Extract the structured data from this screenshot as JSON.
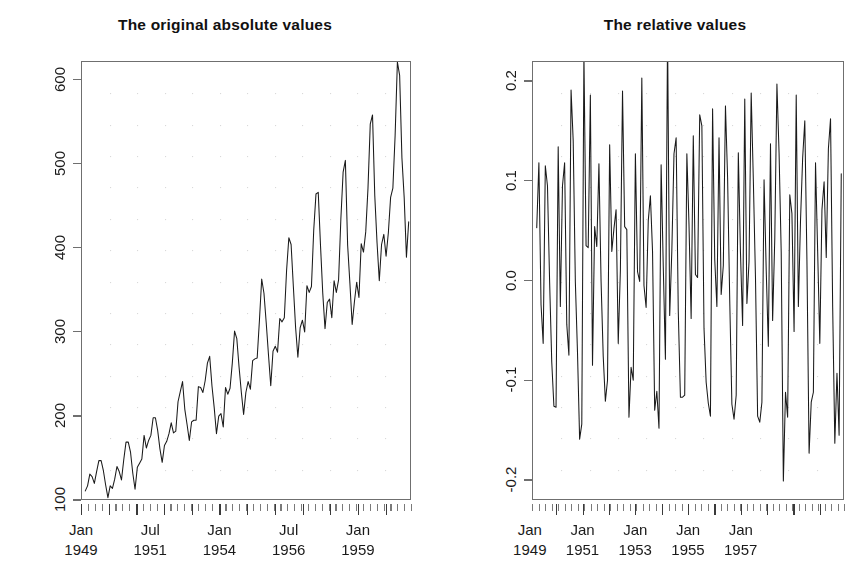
{
  "figure": {
    "width": 794,
    "height": 585,
    "background": "#ffffff",
    "axis_color": "#6f6f6f",
    "line_color": "#1a1a1a",
    "grid_color": "#d9d9d9",
    "panels": 2
  },
  "left_panel": {
    "title": "The original absolute values",
    "y_ticks": [
      "100",
      "200",
      "300",
      "400",
      "500",
      "600"
    ],
    "x_ticks": [
      {
        "month": "Jan",
        "year": "1949"
      },
      {
        "month": "Jul",
        "year": "1951"
      },
      {
        "month": "Jan",
        "year": "1954"
      },
      {
        "month": "Jul",
        "year": "1956"
      },
      {
        "month": "Jan",
        "year": "1959"
      }
    ]
  },
  "right_panel": {
    "title": "The relative values",
    "y_ticks": [
      "-0.2",
      "-0.1",
      "0.0",
      "0.1",
      "0.2"
    ],
    "x_ticks": [
      {
        "month": "Jan",
        "year": "1949"
      },
      {
        "month": "Jan",
        "year": "1951"
      },
      {
        "month": "Jan",
        "year": "1953"
      },
      {
        "month": "Jan",
        "year": "1955"
      },
      {
        "month": "Jan",
        "year": "1957"
      }
    ],
    "clipped_right_edge": true
  },
  "chart_data": [
    {
      "type": "line",
      "id": "absolute",
      "title": "The original absolute values",
      "xlabel": "",
      "ylabel": "",
      "grid": true,
      "legend": "none",
      "xlim": [
        1949.0,
        1960.917
      ],
      "ylim": [
        100,
        622
      ],
      "ytick_values": [
        100,
        200,
        300,
        400,
        500,
        600
      ],
      "xtick_values": [
        1949.0,
        1951.5,
        1954.0,
        1956.5,
        1959.0
      ],
      "xtick_labels": [
        "Jan 1949",
        "Jul 1951",
        "Jan 1954",
        "Jul 1956",
        "Jan 1959"
      ],
      "x_start": 1949.0,
      "x_step": 0.0833333,
      "values": [
        112,
        118,
        132,
        129,
        121,
        135,
        148,
        148,
        136,
        119,
        104,
        118,
        115,
        126,
        141,
        135,
        125,
        149,
        170,
        170,
        158,
        133,
        114,
        140,
        145,
        150,
        178,
        163,
        172,
        178,
        199,
        199,
        184,
        162,
        146,
        166,
        171,
        180,
        193,
        181,
        183,
        218,
        230,
        242,
        209,
        191,
        172,
        194,
        196,
        196,
        236,
        235,
        229,
        243,
        264,
        272,
        237,
        211,
        180,
        201,
        204,
        188,
        235,
        227,
        234,
        264,
        302,
        293,
        259,
        229,
        203,
        229,
        242,
        233,
        267,
        269,
        270,
        315,
        364,
        347,
        312,
        274,
        237,
        278,
        284,
        277,
        317,
        313,
        318,
        374,
        413,
        405,
        355,
        306,
        271,
        306,
        315,
        301,
        356,
        348,
        355,
        422,
        465,
        467,
        404,
        347,
        305,
        336,
        340,
        318,
        362,
        348,
        363,
        435,
        491,
        505,
        404,
        359,
        310,
        337,
        360,
        342,
        406,
        396,
        420,
        472,
        548,
        559,
        463,
        407,
        362,
        405,
        417,
        391,
        419,
        461,
        472,
        535,
        622,
        606,
        508,
        461,
        390,
        432
      ]
    },
    {
      "type": "line",
      "id": "relative",
      "title": "The relative values",
      "xlabel": "",
      "ylabel": "",
      "grid": true,
      "legend": "none",
      "xlim": [
        1949.083,
        1960.917
      ],
      "ylim": [
        -0.22,
        0.22
      ],
      "ytick_values": [
        -0.2,
        -0.1,
        0.0,
        0.1,
        0.2
      ],
      "xtick_values": [
        1949.0,
        1951.0,
        1953.0,
        1955.0,
        1957.0
      ],
      "xtick_labels": [
        "Jan 1949",
        "Jan 1951",
        "Jan 1953",
        "Jan 1955",
        "Jan 1957"
      ],
      "x_start": 1949.0833,
      "x_step": 0.0833333,
      "note": "relative change of consecutive absolute values",
      "values": [
        0.054,
        0.119,
        -0.023,
        -0.062,
        0.116,
        0.096,
        0.0,
        -0.081,
        -0.125,
        -0.126,
        0.135,
        -0.025,
        0.096,
        0.119,
        -0.043,
        -0.074,
        0.192,
        0.141,
        0.0,
        -0.071,
        -0.158,
        -0.143,
        0.228,
        0.036,
        0.034,
        0.187,
        -0.084,
        0.055,
        0.035,
        0.118,
        0.0,
        -0.075,
        -0.12,
        -0.099,
        0.137,
        0.03,
        0.053,
        0.072,
        -0.062,
        0.011,
        0.191,
        0.055,
        0.052,
        -0.136,
        -0.086,
        -0.099,
        0.128,
        0.01,
        0.0,
        0.204,
        -0.004,
        -0.026,
        0.061,
        0.086,
        0.03,
        -0.129,
        -0.11,
        -0.147,
        0.117,
        0.015,
        -0.078,
        0.25,
        -0.034,
        0.031,
        0.128,
        0.144,
        -0.03,
        -0.116,
        -0.116,
        -0.114,
        0.128,
        0.057,
        -0.037,
        0.146,
        0.007,
        0.004,
        0.167,
        0.156,
        -0.047,
        -0.101,
        -0.122,
        -0.135,
        0.173,
        0.022,
        -0.025,
        0.144,
        -0.013,
        0.016,
        0.176,
        0.104,
        -0.019,
        -0.123,
        -0.138,
        -0.114,
        0.129,
        0.029,
        -0.044,
        0.183,
        -0.022,
        0.02,
        0.189,
        0.102,
        0.004,
        -0.135,
        -0.141,
        -0.121,
        0.102,
        0.012,
        -0.065,
        0.138,
        -0.039,
        0.043,
        0.198,
        0.129,
        0.029,
        -0.2,
        -0.111,
        -0.136,
        0.087,
        0.068,
        -0.05,
        0.187,
        -0.025,
        0.061,
        0.124,
        0.161,
        0.02,
        -0.172,
        -0.121,
        -0.111,
        0.119,
        0.03,
        -0.062,
        0.072,
        0.1,
        0.024,
        0.133,
        0.163,
        -0.026,
        -0.162,
        -0.092,
        -0.154,
        0.108
      ]
    }
  ]
}
